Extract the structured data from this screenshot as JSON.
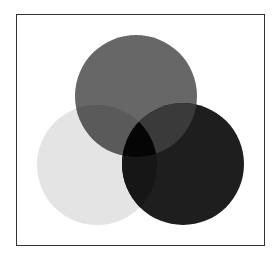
{
  "diagram": {
    "type": "venn-three-circles",
    "frame": {
      "x": 16,
      "y": 14,
      "width": 249,
      "height": 232,
      "border_color": "#333333",
      "background": "#ffffff"
    },
    "circles": [
      {
        "id": "top",
        "cx": 136,
        "cy": 96,
        "r": 61,
        "color": "#676767"
      },
      {
        "id": "left",
        "cx": 97,
        "cy": 165,
        "r": 60,
        "color": "#e4e4e4"
      },
      {
        "id": "right",
        "cx": 183,
        "cy": 164,
        "r": 61,
        "color": "#1e1e1e"
      }
    ],
    "overlaps": {
      "top_left": "#5a5a5a",
      "top_right": "#3a3a3a",
      "left_right": "#161616",
      "all": "#050505"
    }
  }
}
